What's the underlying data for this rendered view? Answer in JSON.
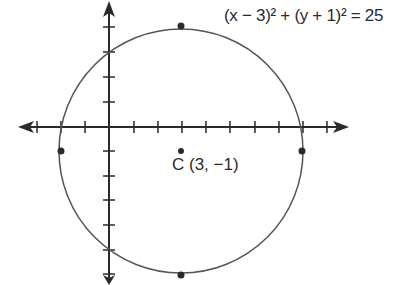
{
  "equation": "(x − 3)² + (y + 1)² = 25",
  "center_label": "C (3, −1)",
  "center": {
    "x": 3,
    "y": -1
  },
  "radius": 5,
  "marked_points": [
    {
      "name": "top",
      "x": 3,
      "y": 4
    },
    {
      "name": "bottom",
      "x": 3,
      "y": -6
    },
    {
      "name": "left",
      "x": -2,
      "y": -1
    },
    {
      "name": "right",
      "x": 8,
      "y": -1
    }
  ],
  "colors": {
    "stroke": "#2a2a2a",
    "circle": "#555555"
  }
}
